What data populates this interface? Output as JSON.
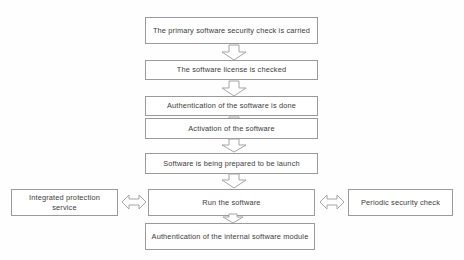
{
  "diagram": {
    "background_color": "#fefefe",
    "node_border_color": "#9a9a9a",
    "node_fill_color": "#ffffff",
    "text_color": "#3a3a3a",
    "arrow_stroke_color": "#a5a5a5",
    "arrow_fill_color": "#ffffff"
  },
  "nodes": {
    "primary_check": "The primary software security check is carried",
    "license_check": "The software license is checked",
    "authentication": "Authentication of the software is done",
    "activation": "Activation of the software",
    "prepared": "Software is being prepared to be launch",
    "run_software": "Run the software",
    "integrated_protection": "Integrated protection service",
    "periodic_check": "Periodic security check",
    "internal_auth": "Authentication of the internal software module"
  },
  "connectors": {
    "c1": "down-arrow",
    "c2": "down-arrow",
    "c3": "down-arrow",
    "c4": "down-arrow",
    "c5": "down-arrow",
    "c6": "double-headed-left-right-arrow",
    "c7": "double-headed-left-right-arrow",
    "c8": "down-arrow"
  }
}
